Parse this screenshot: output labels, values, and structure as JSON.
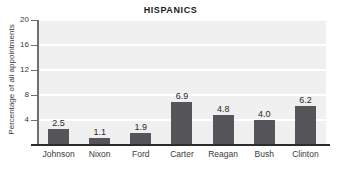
{
  "chart_data": {
    "type": "bar",
    "title": "HISPANICS",
    "xlabel": "",
    "ylabel": "Percentage of all appointments",
    "categories": [
      "Johnson",
      "Nixon",
      "Ford",
      "Carter",
      "Reagan",
      "Bush",
      "Clinton"
    ],
    "values": [
      2.5,
      1.1,
      1.9,
      6.9,
      4.8,
      4.0,
      6.2
    ],
    "value_labels": [
      "2.5",
      "1.1",
      "1.9",
      "6.9",
      "4.8",
      "4.0",
      "6.2"
    ],
    "ylim": [
      0,
      20
    ],
    "yticks": [
      4,
      8,
      12,
      16,
      20
    ],
    "ytick_labels": [
      "4",
      "8",
      "12",
      "16",
      "20"
    ],
    "grid": true,
    "legend": null,
    "colors": {
      "bar": "#56565a",
      "plot_background": "#f0f0f0",
      "gridline": "#ffffff",
      "axis": "#2c2c2c",
      "text": "#3a3a3a",
      "title": "#1b1b1b"
    }
  }
}
